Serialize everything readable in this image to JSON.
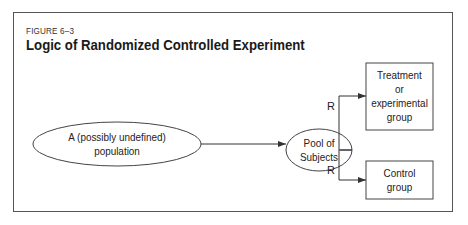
{
  "figure": {
    "label": "FIGURE 6–3",
    "title": "Logic of Randomized Controlled Experiment"
  },
  "nodes": {
    "population": {
      "line1": "A (possibly undefined)",
      "line2": "population",
      "shape": "ellipse"
    },
    "pool": {
      "line1": "Pool of",
      "line2": "Subjects",
      "shape": "ellipse"
    },
    "treatment": {
      "line1": "Treatment",
      "line2": "or",
      "line3": "experimental",
      "line4": "group",
      "shape": "rectangle"
    },
    "control": {
      "line1": "Control",
      "line2": "group",
      "shape": "rectangle"
    }
  },
  "edges": [
    {
      "from": "population",
      "to": "pool",
      "label": ""
    },
    {
      "from": "pool",
      "to": "treatment",
      "label": "R"
    },
    {
      "from": "pool",
      "to": "control",
      "label": "R"
    }
  ],
  "edge_labels": {
    "treatment_r": "R",
    "control_r": "R"
  },
  "colors": {
    "stroke": "#333333",
    "text": "#222222"
  }
}
